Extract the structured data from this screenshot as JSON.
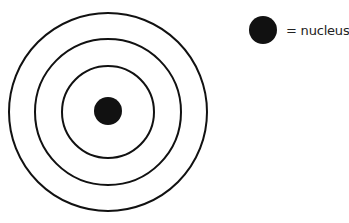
{
  "diagram": {
    "type": "atom-shell-model",
    "center": {
      "x": 108,
      "y": 112
    },
    "shells": [
      {
        "name": "outer-shell",
        "radius": 99
      },
      {
        "name": "middle-shell",
        "radius": 73
      },
      {
        "name": "inner-shell",
        "radius": 46
      }
    ],
    "shell_count": 3,
    "nucleus": {
      "radius": 14
    },
    "colors": {
      "line": "#111111",
      "nucleus": "#111111",
      "background": "#ffffff"
    }
  },
  "legend": {
    "symbol": "filled-black-circle",
    "label": "= nucleus"
  }
}
